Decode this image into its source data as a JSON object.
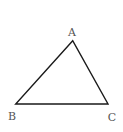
{
  "diagram": {
    "type": "triangle",
    "vertices": [
      {
        "label": "A",
        "x": 72.7,
        "y": 40.7,
        "label_x": 72,
        "label_y": 36
      },
      {
        "label": "B",
        "x": 15.7,
        "y": 104,
        "label_x": 12,
        "label_y": 120
      },
      {
        "label": "C",
        "x": 108,
        "y": 104,
        "label_x": 112,
        "label_y": 121
      }
    ],
    "stroke_color": "#1a1a1a",
    "label_color": "#555555"
  }
}
